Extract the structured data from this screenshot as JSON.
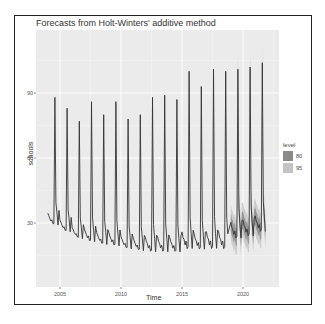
{
  "chart_data": {
    "type": "line",
    "title": "Forecasts from Holt-Winters' additive method",
    "xlabel": "Time",
    "ylabel": "schools",
    "x_ticks": [
      "2005",
      "2010",
      "2015",
      "2020"
    ],
    "y_ticks": [
      "30",
      "60",
      "90"
    ],
    "xlim": [
      2003.5,
      2022.5
    ],
    "ylim": [
      0,
      108
    ],
    "grid": true,
    "legend": {
      "title": "level",
      "position": "right",
      "entries": [
        "80",
        "95"
      ]
    },
    "series": [
      {
        "name": "observed",
        "frequency": "monthly",
        "start": 2004.0,
        "end": 2018.75,
        "annual_peaks": [
          {
            "year": 2004.6,
            "value": 88
          },
          {
            "year": 2005.6,
            "value": 83
          },
          {
            "year": 2006.6,
            "value": 77
          },
          {
            "year": 2007.6,
            "value": 86
          },
          {
            "year": 2008.6,
            "value": 80
          },
          {
            "year": 2009.6,
            "value": 86
          },
          {
            "year": 2010.6,
            "value": 78
          },
          {
            "year": 2011.6,
            "value": 80
          },
          {
            "year": 2012.6,
            "value": 88
          },
          {
            "year": 2013.6,
            "value": 89
          },
          {
            "year": 2014.6,
            "value": 87
          },
          {
            "year": 2015.6,
            "value": 100
          },
          {
            "year": 2016.6,
            "value": 93
          },
          {
            "year": 2017.6,
            "value": 101
          },
          {
            "year": 2018.6,
            "value": 100
          }
        ],
        "annual_troughs": [
          27,
          24,
          21,
          19,
          18,
          17,
          16,
          15,
          14,
          14,
          14,
          15,
          15,
          15
        ]
      },
      {
        "name": "forecast",
        "start": 2018.75,
        "end": 2021.9,
        "annual_peaks": [
          {
            "year": 2019.6,
            "value": 101
          },
          {
            "year": 2020.6,
            "value": 102
          },
          {
            "year": 2021.6,
            "value": 104
          }
        ],
        "annual_troughs": [
          20,
          21,
          23
        ],
        "interval_80_halfwidth": 4,
        "interval_95_halfwidth": 8
      }
    ]
  },
  "colors": {
    "panel_bg": "#ebebeb",
    "grid_major": "#ffffff",
    "line": "#333333",
    "band_80": "#8a8a8a",
    "band_95": "#c4c4c4"
  }
}
